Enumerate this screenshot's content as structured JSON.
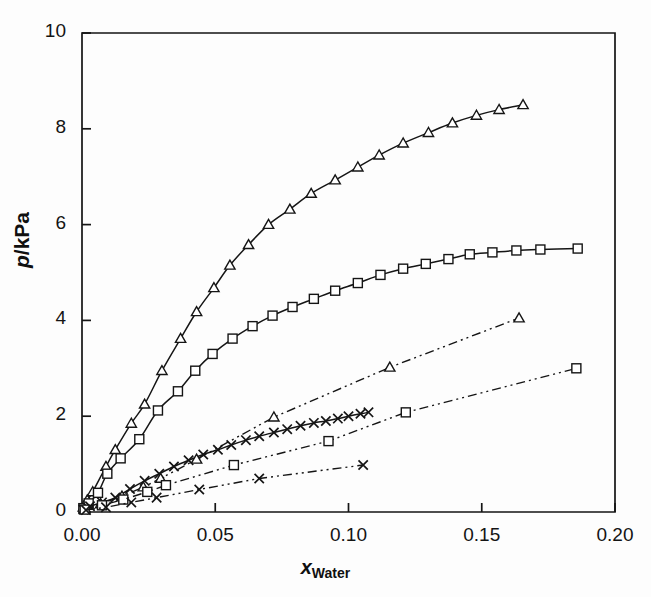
{
  "figure": {
    "background": "#fdfdfd",
    "ink": "#151515"
  },
  "axes": {
    "x_label_prefix": "x",
    "x_label_sub": "Water",
    "y_label_num": "p",
    "y_label_sep": "/",
    "y_label_unit": "kPa",
    "x_ticks": [
      "0.00",
      "0.05",
      "0.10",
      "0.15",
      "0.20"
    ],
    "y_ticks": [
      "0",
      "2",
      "4",
      "6",
      "8",
      "10"
    ]
  },
  "chart_data": {
    "type": "line",
    "title": "",
    "xlabel": "x_Water",
    "ylabel": "p / kPa",
    "xlim": [
      0.0,
      0.2
    ],
    "ylim": [
      0,
      10
    ],
    "xticks": [
      0.0,
      0.05,
      0.1,
      0.15,
      0.2
    ],
    "yticks": [
      0,
      2,
      4,
      6,
      8,
      10
    ],
    "grid": false,
    "legend": "none",
    "series": [
      {
        "name": "upper-triangle-solid",
        "marker": "triangle",
        "linestyle": "solid",
        "points": [
          [
            0.0005,
            0.1
          ],
          [
            0.002,
            0.25
          ],
          [
            0.004,
            0.42
          ],
          [
            0.009,
            0.95
          ],
          [
            0.0125,
            1.3
          ],
          [
            0.0185,
            1.85
          ],
          [
            0.0235,
            2.25
          ],
          [
            0.03,
            2.95
          ],
          [
            0.037,
            3.62
          ],
          [
            0.043,
            4.18
          ],
          [
            0.0495,
            4.68
          ],
          [
            0.0555,
            5.15
          ],
          [
            0.0625,
            5.58
          ],
          [
            0.07,
            6.0
          ],
          [
            0.078,
            6.32
          ],
          [
            0.086,
            6.65
          ],
          [
            0.095,
            6.93
          ],
          [
            0.1035,
            7.2
          ],
          [
            0.1115,
            7.45
          ],
          [
            0.1205,
            7.7
          ],
          [
            0.13,
            7.92
          ],
          [
            0.139,
            8.12
          ],
          [
            0.148,
            8.28
          ],
          [
            0.1565,
            8.4
          ],
          [
            0.1655,
            8.5
          ]
        ]
      },
      {
        "name": "upper-square-solid",
        "marker": "square",
        "linestyle": "solid",
        "points": [
          [
            0.0005,
            0.08
          ],
          [
            0.0025,
            0.18
          ],
          [
            0.006,
            0.4
          ],
          [
            0.0095,
            0.8
          ],
          [
            0.0145,
            1.12
          ],
          [
            0.0215,
            1.52
          ],
          [
            0.0285,
            2.12
          ],
          [
            0.036,
            2.52
          ],
          [
            0.0425,
            2.95
          ],
          [
            0.049,
            3.3
          ],
          [
            0.0565,
            3.62
          ],
          [
            0.064,
            3.88
          ],
          [
            0.0715,
            4.1
          ],
          [
            0.079,
            4.28
          ],
          [
            0.087,
            4.45
          ],
          [
            0.095,
            4.62
          ],
          [
            0.1035,
            4.78
          ],
          [
            0.112,
            4.95
          ],
          [
            0.1205,
            5.08
          ],
          [
            0.129,
            5.18
          ],
          [
            0.1375,
            5.28
          ],
          [
            0.1455,
            5.38
          ],
          [
            0.154,
            5.42
          ],
          [
            0.163,
            5.46
          ],
          [
            0.172,
            5.48
          ],
          [
            0.186,
            5.5
          ]
        ]
      },
      {
        "name": "middle-cross-solid",
        "marker": "cross",
        "linestyle": "solid",
        "points": [
          [
            0.0005,
            0.05
          ],
          [
            0.003,
            0.12
          ],
          [
            0.0075,
            0.2
          ],
          [
            0.0125,
            0.3
          ],
          [
            0.018,
            0.48
          ],
          [
            0.0235,
            0.65
          ],
          [
            0.029,
            0.8
          ],
          [
            0.0345,
            0.95
          ],
          [
            0.04,
            1.08
          ],
          [
            0.0455,
            1.2
          ],
          [
            0.051,
            1.3
          ],
          [
            0.056,
            1.4
          ],
          [
            0.0615,
            1.5
          ],
          [
            0.0665,
            1.58
          ],
          [
            0.072,
            1.66
          ],
          [
            0.077,
            1.73
          ],
          [
            0.082,
            1.8
          ],
          [
            0.087,
            1.86
          ],
          [
            0.0915,
            1.9
          ],
          [
            0.096,
            1.95
          ],
          [
            0.1,
            2.0
          ],
          [
            0.1045,
            2.05
          ],
          [
            0.1075,
            2.08
          ]
        ]
      },
      {
        "name": "lower-triangle-dashdot",
        "marker": "triangle",
        "linestyle": "dashdotdot",
        "points": [
          [
            0.001,
            0.06
          ],
          [
            0.007,
            0.17
          ],
          [
            0.015,
            0.33
          ],
          [
            0.023,
            0.52
          ],
          [
            0.0295,
            0.7
          ],
          [
            0.043,
            1.1
          ],
          [
            0.072,
            1.98
          ],
          [
            0.1155,
            3.02
          ],
          [
            0.164,
            4.05
          ]
        ]
      },
      {
        "name": "lower-square-dashdot",
        "marker": "square",
        "linestyle": "dashdotdot",
        "points": [
          [
            0.001,
            0.05
          ],
          [
            0.0075,
            0.14
          ],
          [
            0.0155,
            0.26
          ],
          [
            0.0245,
            0.42
          ],
          [
            0.0315,
            0.56
          ],
          [
            0.057,
            0.98
          ],
          [
            0.0925,
            1.48
          ],
          [
            0.1215,
            2.08
          ],
          [
            0.1855,
            3.0
          ]
        ]
      },
      {
        "name": "lower-cross-dashdot",
        "marker": "cross",
        "linestyle": "dashdotdot",
        "points": [
          [
            0.0015,
            0.04
          ],
          [
            0.009,
            0.1
          ],
          [
            0.0185,
            0.2
          ],
          [
            0.028,
            0.3
          ],
          [
            0.044,
            0.47
          ],
          [
            0.0665,
            0.7
          ],
          [
            0.1055,
            0.98
          ]
        ]
      }
    ]
  }
}
